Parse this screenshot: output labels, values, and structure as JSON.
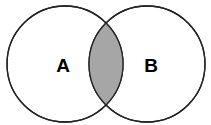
{
  "diagram": {
    "type": "venn",
    "sets": [
      {
        "label": "A",
        "cx": 65,
        "cy": 64,
        "r": 58
      },
      {
        "label": "B",
        "cx": 147,
        "cy": 64,
        "r": 58
      }
    ],
    "highlighted_region": "A ∩ B",
    "colors": {
      "stroke": "#222222",
      "fill": "#ffffff",
      "intersection_fill": "#a6a6a6"
    }
  }
}
